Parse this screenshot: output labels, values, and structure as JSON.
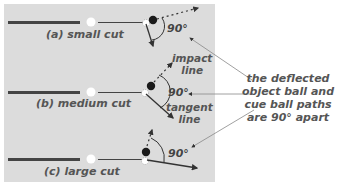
{
  "colors": {
    "panel_bg": "#dcdcdc",
    "page_bg": "#ffffff",
    "stick": "#444444",
    "object_ball": "#1a1a1a",
    "cue_ball": "#ffffff",
    "text": "#555555",
    "pointer": "#888888"
  },
  "cases": [
    {
      "label": "(a)  small cut",
      "angle_label": "90°"
    },
    {
      "label": "(b)  medium cut",
      "angle_label": "90°"
    },
    {
      "label": "(c)  large cut",
      "angle_label": "90°"
    }
  ],
  "line_labels": {
    "impact": [
      "impact",
      "line"
    ],
    "tangent": [
      "tangent",
      "line"
    ]
  },
  "note": {
    "lines": [
      "the deflected",
      "object ball and",
      "cue ball paths",
      "are 90° apart"
    ]
  }
}
